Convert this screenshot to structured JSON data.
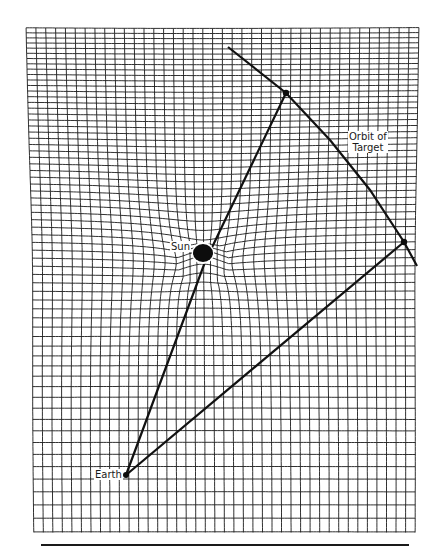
{
  "diagram": {
    "colors": {
      "grid": "#1a1a1a",
      "lines": "#111111",
      "background": "#ffffff"
    },
    "grid": {
      "left": 25,
      "right": 420,
      "top": 25,
      "bottom": 532,
      "columns": 40,
      "rows_top_spacing": 5,
      "rows_bottom_spacing": 14,
      "well_center": [
        203,
        253
      ]
    },
    "bodies": {
      "sun": {
        "label": "Sun",
        "x": 203,
        "y": 253,
        "r": 9
      },
      "earth": {
        "label": "Earth",
        "x": 126,
        "y": 475,
        "r": 3
      }
    },
    "target": {
      "label_line1": "Orbit of",
      "label_line2": "Target",
      "positions": [
        {
          "name": "target-position-1",
          "x": 286,
          "y": 93
        },
        {
          "name": "target-position-2",
          "x": 404,
          "y": 242
        }
      ],
      "orbit_path": [
        [
          228,
          47
        ],
        [
          286,
          93
        ],
        [
          330,
          140
        ],
        [
          370,
          190
        ],
        [
          404,
          242
        ],
        [
          417,
          266
        ]
      ]
    },
    "signal_paths": [
      {
        "name": "signal-path-near-sun",
        "points": [
          [
            126,
            475
          ],
          [
            205,
            262
          ],
          [
            286,
            93
          ]
        ]
      },
      {
        "name": "signal-path-direct",
        "points": [
          [
            126,
            475
          ],
          [
            404,
            242
          ]
        ]
      }
    ]
  }
}
